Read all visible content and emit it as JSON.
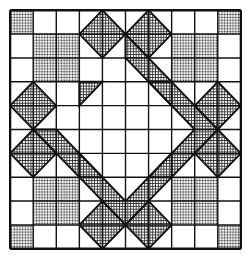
{
  "diagram": {
    "type": "quilt-block-pattern",
    "grid": {
      "rows": 10,
      "cols": 10
    },
    "colors": {
      "line": "#111111",
      "background": "#ffffff",
      "dot_fill": "#9a9a9a",
      "hatch_fill": "#8a8a8a"
    },
    "dotted_squares": [
      [
        0,
        0
      ],
      [
        9,
        0
      ],
      [
        0,
        9
      ],
      [
        9,
        9
      ],
      [
        1,
        1
      ],
      [
        2,
        1
      ],
      [
        1,
        2
      ],
      [
        2,
        2
      ],
      [
        7,
        1
      ],
      [
        8,
        1
      ],
      [
        7,
        2
      ],
      [
        8,
        2
      ],
      [
        1,
        7
      ],
      [
        2,
        7
      ],
      [
        1,
        8
      ],
      [
        2,
        8
      ],
      [
        7,
        7
      ],
      [
        8,
        7
      ],
      [
        7,
        8
      ],
      [
        8,
        8
      ]
    ],
    "hatched_polygons": [
      [
        [
          5,
          1
        ],
        [
          9,
          5
        ],
        [
          5,
          9
        ],
        [
          1,
          5
        ],
        [
          2,
          5
        ],
        [
          5,
          8
        ],
        [
          8,
          5
        ],
        [
          5,
          2
        ]
      ],
      [
        [
          3,
          1
        ],
        [
          4,
          0
        ],
        [
          5,
          1
        ],
        [
          4,
          2
        ]
      ],
      [
        [
          5,
          1
        ],
        [
          6,
          0
        ],
        [
          7,
          1
        ],
        [
          6,
          2
        ]
      ],
      [
        [
          3,
          9
        ],
        [
          4,
          8
        ],
        [
          5,
          9
        ],
        [
          4,
          10
        ]
      ],
      [
        [
          5,
          9
        ],
        [
          6,
          8
        ],
        [
          7,
          9
        ],
        [
          6,
          10
        ]
      ],
      [
        [
          1,
          3
        ],
        [
          0,
          4
        ],
        [
          1,
          5
        ],
        [
          2,
          4
        ]
      ],
      [
        [
          1,
          5
        ],
        [
          0,
          6
        ],
        [
          1,
          7
        ],
        [
          2,
          6
        ]
      ],
      [
        [
          9,
          3
        ],
        [
          10,
          4
        ],
        [
          9,
          5
        ],
        [
          8,
          4
        ]
      ],
      [
        [
          9,
          5
        ],
        [
          10,
          6
        ],
        [
          9,
          7
        ],
        [
          8,
          6
        ]
      ],
      [
        [
          3,
          3
        ],
        [
          4,
          3
        ],
        [
          3,
          4
        ]
      ],
      [
        [
          7,
          3
        ],
        [
          6,
          3
        ],
        [
          7,
          4
        ]
      ],
      [
        [
          3,
          7
        ],
        [
          4,
          7
        ],
        [
          3,
          6
        ]
      ],
      [
        [
          7,
          7
        ],
        [
          6,
          7
        ],
        [
          7,
          6
        ]
      ]
    ]
  }
}
